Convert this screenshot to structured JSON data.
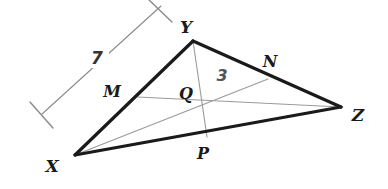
{
  "figure": {
    "background_color": "#ffffff",
    "edge_color": "#1a1a1a",
    "cevian_color": "#9a9a9a",
    "measure_color": "#8a8a8a",
    "label_color": "#1a1a1a",
    "measure_number_color": "#555555"
  },
  "vertices": [
    {
      "name": "X",
      "label": "X",
      "x": 75,
      "y": 155,
      "label_x": 52,
      "label_y": 172
    },
    {
      "name": "Y",
      "label": "Y",
      "x": 193,
      "y": 41,
      "label_x": 186,
      "label_y": 33
    },
    {
      "name": "Z",
      "label": "Z",
      "x": 341,
      "y": 107,
      "label_x": 356,
      "label_y": 121
    }
  ],
  "midpoints": [
    {
      "name": "M",
      "label": "M",
      "on_segment": "XY",
      "x": 138,
      "y": 97,
      "label_x": 108,
      "label_y": 97
    },
    {
      "name": "N",
      "label": "N",
      "on_segment": "YZ",
      "x": 268,
      "y": 79,
      "label_x": 268,
      "label_y": 68
    },
    {
      "name": "P",
      "label": "P",
      "on_segment": "XZ",
      "x": 207,
      "y": 137,
      "label_x": 200,
      "label_y": 158
    }
  ],
  "centroid": {
    "name": "Q",
    "label": "Q",
    "x": 202,
    "y": 106,
    "label_x": 183,
    "label_y": 98
  },
  "edges": [
    {
      "name": "side-XY",
      "from": "X",
      "to": "Y",
      "x1": 75,
      "y1": 155,
      "x2": 193,
      "y2": 41,
      "width": 3
    },
    {
      "name": "side-YZ",
      "from": "Y",
      "to": "Z",
      "x1": 193,
      "y1": 41,
      "x2": 341,
      "y2": 107,
      "width": 3
    },
    {
      "name": "side-XZ",
      "from": "X",
      "to": "Z",
      "x1": 75,
      "y1": 155,
      "x2": 341,
      "y2": 107,
      "width": 3
    }
  ],
  "medians": [
    {
      "name": "median-XN",
      "from": "X",
      "to": "N",
      "x1": 75,
      "y1": 155,
      "x2": 268,
      "y2": 79,
      "width": 1
    },
    {
      "name": "median-YP",
      "from": "Y",
      "to": "P",
      "x1": 193,
      "y1": 41,
      "x2": 207,
      "y2": 137,
      "width": 1
    },
    {
      "name": "median-MZ",
      "from": "M",
      "to": "Z",
      "x1": 138,
      "y1": 97,
      "x2": 341,
      "y2": 107,
      "width": 1
    }
  ],
  "measures": [
    {
      "name": "measure-7",
      "value": "7",
      "describes": "length of segment XY",
      "line": {
        "x1": 42,
        "y1": 114,
        "x2": 161,
        "y2": 6
      },
      "tick_start": {
        "x1": 30,
        "y1": 102,
        "x2": 53,
        "y2": 128
      },
      "tick_end": {
        "x1": 149,
        "y1": 0,
        "x2": 172,
        "y2": 22
      },
      "label_x": 97,
      "label_y": 64,
      "font_size": 17
    },
    {
      "name": "measure-3",
      "value": "3",
      "describes": "length of segment QN",
      "label_x": 222,
      "label_y": 81,
      "font_size": 16
    }
  ]
}
